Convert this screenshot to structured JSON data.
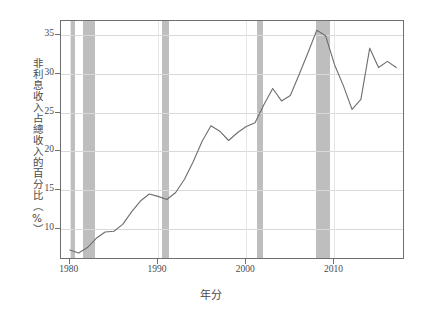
{
  "chart_data": {
    "type": "line",
    "title": "",
    "xlabel": "年分",
    "ylabel": "非利息收入占總收入的百分比（%）",
    "xlim": [
      1979,
      2018
    ],
    "ylim": [
      6.0,
      36.8
    ],
    "grid": true,
    "legend": "none",
    "line_color": "#6e6e6e",
    "band_color": "#b9b9b9",
    "xticks": [
      "1980",
      "1990",
      "2000",
      "2010"
    ],
    "xtick_values": [
      1980,
      1990,
      2000,
      2010
    ],
    "yticks": [
      "10",
      "15",
      "20",
      "25",
      "30",
      "35"
    ],
    "ytick_values": [
      10,
      15,
      20,
      25,
      30,
      35
    ],
    "x": [
      1980,
      1981,
      1982,
      1983,
      1984,
      1985,
      1986,
      1987,
      1988,
      1989,
      1990,
      1991,
      1992,
      1993,
      1994,
      1995,
      1996,
      1997,
      1998,
      1999,
      2000,
      2001,
      2002,
      2003,
      2004,
      2005,
      2006,
      2007,
      2008,
      2009,
      2010,
      2011,
      2012,
      2013,
      2014,
      2015,
      2016,
      2017
    ],
    "values": [
      7.3,
      6.9,
      7.6,
      8.8,
      9.6,
      9.7,
      10.6,
      12.2,
      13.6,
      14.5,
      14.2,
      13.8,
      14.7,
      16.4,
      18.7,
      21.3,
      23.3,
      22.6,
      21.4,
      22.4,
      23.2,
      23.7,
      26.0,
      28.1,
      26.5,
      27.2,
      29.9,
      32.7,
      35.6,
      34.9,
      31.2,
      28.5,
      25.4,
      26.7,
      33.3,
      30.8,
      31.6,
      30.8
    ],
    "series": [
      {
        "name": "非利息收入占總收入的百分比",
        "values": [
          7.3,
          6.9,
          7.6,
          8.8,
          9.6,
          9.7,
          10.6,
          12.2,
          13.6,
          14.5,
          14.2,
          13.8,
          14.7,
          16.4,
          18.7,
          21.3,
          23.3,
          22.6,
          21.4,
          22.4,
          23.2,
          23.7,
          26.0,
          28.1,
          26.5,
          27.2,
          29.9,
          32.7,
          35.6,
          34.9,
          31.2,
          28.5,
          25.4,
          26.7,
          33.3,
          30.8,
          31.6,
          30.8
        ]
      }
    ],
    "shaded_bands": [
      {
        "name": "recession-1980",
        "start": 1980.0,
        "end": 1980.6
      },
      {
        "name": "recession-1981-1982",
        "start": 1981.5,
        "end": 1982.9
      },
      {
        "name": "recession-1990-1991",
        "start": 1990.5,
        "end": 1991.3
      },
      {
        "name": "recession-2001",
        "start": 2001.2,
        "end": 2001.9
      },
      {
        "name": "recession-2007-2009",
        "start": 2007.9,
        "end": 2009.5
      }
    ]
  },
  "axes": {
    "y_title": "非利息收入占總收入的百分比（%）",
    "x_title": "年分"
  }
}
